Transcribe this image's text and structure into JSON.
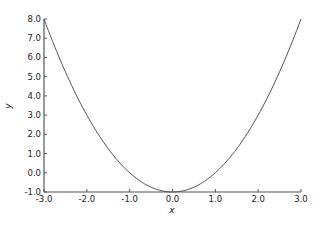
{
  "chart_data": {
    "type": "line",
    "title": "",
    "xlabel": "x",
    "ylabel": "y",
    "xlim": [
      -3.0,
      3.0
    ],
    "ylim": [
      -1.0,
      8.0
    ],
    "grid": false,
    "legend": null,
    "x_ticks": [
      "-3.0",
      "-2.0",
      "-1.0",
      "0.0",
      "1.0",
      "2.0",
      "3.0"
    ],
    "y_ticks": [
      "-1.0",
      "0.0",
      "1.0",
      "2.0",
      "3.0",
      "4.0",
      "5.0",
      "6.0",
      "7.0",
      "8.0"
    ],
    "series": [
      {
        "name": "y = x^2 - 1",
        "color": "#555555",
        "x": [
          -3.0,
          -2.5,
          -2.0,
          -1.5,
          -1.0,
          -0.5,
          0.0,
          0.5,
          1.0,
          1.5,
          2.0,
          2.5,
          3.0
        ],
        "y": [
          8.0,
          5.25,
          3.0,
          1.25,
          0.0,
          -0.75,
          -1.0,
          -0.75,
          0.0,
          1.25,
          3.0,
          5.25,
          8.0
        ]
      }
    ]
  }
}
